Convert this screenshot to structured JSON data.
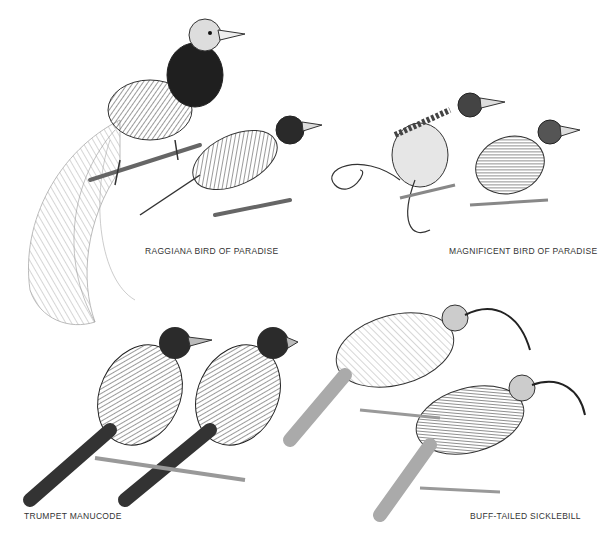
{
  "plate": {
    "labels": {
      "raggiana": "RAGGIANA BIRD OF PARADISE",
      "magnificent": "MAGNIFICENT BIRD OF PARADISE",
      "manucode": "TRUMPET MANUCODE",
      "sicklebill": "BUFF-TAILED SICKLEBILL"
    }
  },
  "colors": {
    "ink": "#2a2a2a",
    "mid": "#6a6a6a",
    "light": "#b5b5b5",
    "paper": "#ffffff"
  }
}
